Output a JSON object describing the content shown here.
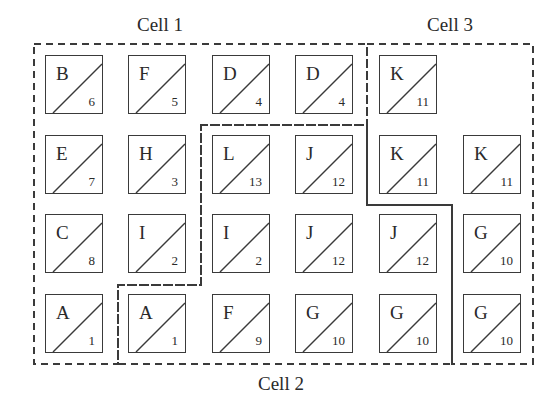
{
  "labels": {
    "cell1": "Cell 1",
    "cell2": "Cell 2",
    "cell3": "Cell 3"
  },
  "colors": {
    "stroke": "#3a3a3a",
    "text": "#2a2a2a",
    "background": "#ffffff"
  },
  "grid": {
    "rows": [
      [
        {
          "letter": "B",
          "num": "6"
        },
        {
          "letter": "F",
          "num": "5"
        },
        {
          "letter": "D",
          "num": "4"
        },
        {
          "letter": "D",
          "num": "4"
        },
        {
          "letter": "K",
          "num": "11"
        },
        null
      ],
      [
        {
          "letter": "E",
          "num": "7"
        },
        {
          "letter": "H",
          "num": "3"
        },
        {
          "letter": "L",
          "num": "13"
        },
        {
          "letter": "J",
          "num": "12"
        },
        {
          "letter": "K",
          "num": "11"
        },
        {
          "letter": "K",
          "num": "11"
        }
      ],
      [
        {
          "letter": "C",
          "num": "8"
        },
        {
          "letter": "I",
          "num": "2"
        },
        {
          "letter": "I",
          "num": "2"
        },
        {
          "letter": "J",
          "num": "12"
        },
        {
          "letter": "J",
          "num": "12"
        },
        {
          "letter": "G",
          "num": "10"
        }
      ],
      [
        {
          "letter": "A",
          "num": "1"
        },
        {
          "letter": "A",
          "num": "1"
        },
        {
          "letter": "F",
          "num": "9"
        },
        {
          "letter": "G",
          "num": "10"
        },
        {
          "letter": "G",
          "num": "10"
        },
        {
          "letter": "G",
          "num": "10"
        }
      ]
    ]
  }
}
